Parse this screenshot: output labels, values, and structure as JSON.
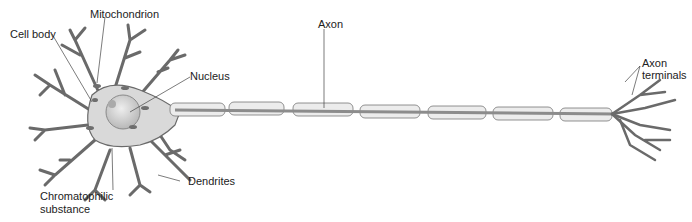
{
  "diagram": {
    "labels": {
      "mitochondrion": "Mitochondrion",
      "cell_body": "Cell body",
      "nucleus": "Nucleus",
      "axon": "Axon",
      "axon_terminals_1": "Axon",
      "axon_terminals_2": "terminals",
      "dendrites": "Dendrites",
      "chromatophilic_1": "Chromatophilic",
      "chromatophilic_2": "substance"
    },
    "colors": {
      "membrane": "#d9d9d9",
      "outline": "#555555",
      "axon_core": "#8c8c8c",
      "nucleus": "#cfcfcf",
      "organelle": "#6e6e6e",
      "text": "#222222"
    }
  }
}
